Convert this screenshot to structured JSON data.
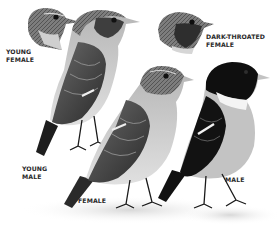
{
  "illustration": {
    "subject": "Stonechat plumage variants",
    "palette": {
      "background": "#ffffff",
      "ink": "#1a1a1a",
      "mid_gray": "#8a8a8a",
      "light_gray": "#c8c8c8",
      "label": "#2a2a2a"
    },
    "labels": {
      "young_female": "YOUNG\nFEMALE",
      "dark_throated_female": "DARK-THROATED\nFEMALE",
      "young_male": "YOUNG\nMALE",
      "female": "FEMALE",
      "male": "MALE"
    }
  }
}
